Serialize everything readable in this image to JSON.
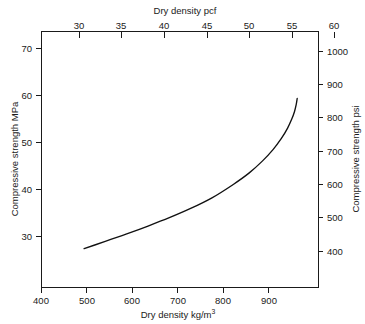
{
  "chart_data": {
    "type": "line",
    "title": "",
    "background": "#ffffff",
    "curve_color": "#111111",
    "axis_color": "#1a1a1a",
    "grid": false,
    "legend": null,
    "axes": {
      "bottom": {
        "label": "Dry density kg/m",
        "label_sup": "3",
        "unit": "kg/m3",
        "ticks": [
          400,
          500,
          600,
          700,
          800,
          900
        ],
        "tick_labels": [
          "400",
          "500",
          "600",
          "700",
          "800",
          "900"
        ],
        "lim": [
          400,
          920
        ]
      },
      "top": {
        "label": "Dry density pcf",
        "unit": "pcf",
        "ticks": [
          30,
          35,
          40,
          45,
          50,
          55,
          60
        ],
        "tick_labels": [
          "30",
          "35",
          "40",
          "45",
          "50",
          "55",
          "60"
        ],
        "lim": [
          25.0,
          57.4
        ]
      },
      "left": {
        "label": "Compressive strength MPa",
        "unit": "MPa",
        "ticks": [
          30,
          40,
          50,
          60,
          70
        ],
        "tick_labels": [
          "30",
          "40",
          "50",
          "60",
          "70"
        ],
        "lim": [
          19.1,
          74.5
        ]
      },
      "right": {
        "label": "Compressive strength psi",
        "unit": "psi",
        "ticks": [
          400,
          500,
          600,
          700,
          800,
          900,
          1000
        ],
        "tick_labels": [
          "400",
          "500",
          "600",
          "700",
          "800",
          "900",
          "1000"
        ],
        "lim": [
          272,
          1068
        ]
      }
    },
    "series": [
      {
        "name": "Compressive strength vs dry density",
        "x": [
          480,
          500,
          530,
          560,
          600,
          640,
          680,
          720,
          760,
          790,
          815,
          835,
          850,
          862,
          870,
          875,
          878,
          880
        ],
        "y": [
          27.5,
          28.3,
          29.5,
          30.7,
          32.4,
          34.2,
          36.2,
          38.5,
          41.4,
          43.9,
          46.5,
          49.0,
          51.3,
          53.6,
          55.6,
          57.2,
          58.6,
          60.0
        ],
        "xlabel": "Dry density kg/m3",
        "ylabel": "Compressive strength MPa"
      }
    ]
  }
}
